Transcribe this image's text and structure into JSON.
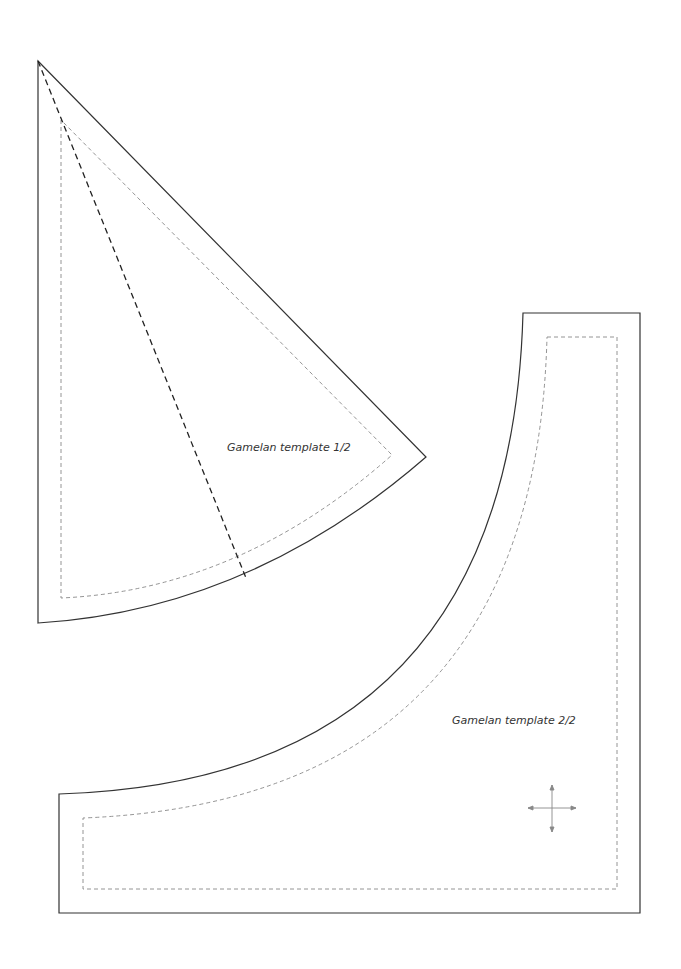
{
  "page": {
    "width": 681,
    "height": 969,
    "background": "#ffffff"
  },
  "templates": [
    {
      "label": "Gamelan template 1/2"
    },
    {
      "label": "Gamelan template 2/2"
    }
  ],
  "colors": {
    "cut_line": "#333333",
    "seam_line": "#888888",
    "fold_line": "#222222",
    "grain_arrow": "#888888"
  }
}
